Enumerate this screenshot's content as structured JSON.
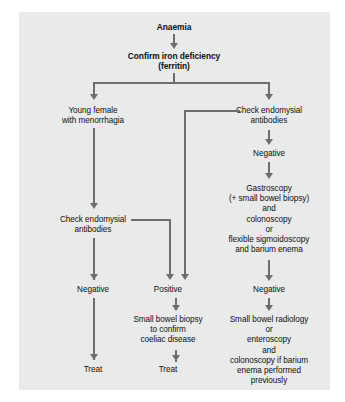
{
  "diagram": {
    "background_color": "#e9eaea",
    "line_color": "#6b6d6e",
    "text_color": "#101010",
    "nodes": {
      "anaemia": "Anaemia",
      "confirm": "Confirm iron deficiency\n(ferritin)",
      "young_female": "Young female\nwith menorrhagia",
      "check_endomysial_right": "Check endomysial\nantibodies",
      "negative_right_1": "Negative",
      "gastroscopy": "Gastroscopy\n(+ small bowel biopsy)\nand\ncolonoscopy\nor\nflexible sigmoidoscopy\nand barium enema",
      "check_endomysial_left": "Check endomysial\nantibodies",
      "negative_left": "Negative",
      "positive_middle": "Positive",
      "small_bowel_biopsy": "Small bowel biopsy\nto confirm\ncoeliac disease",
      "negative_right_2": "Negative",
      "small_bowel_radiology": "Small bowel radiology\nor\nenteroscopy\nand\ncolonoscopy if barium\nenema performed\npreviously",
      "treat_left": "Treat",
      "treat_middle": "Treat"
    }
  }
}
